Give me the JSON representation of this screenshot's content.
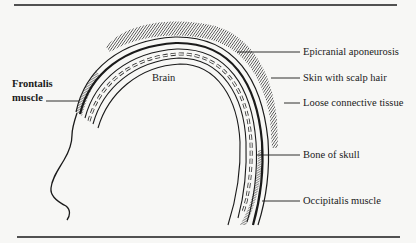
{
  "diagram": {
    "type": "anatomical cross-section of scalp layers (lateral view)",
    "labels": {
      "frontalis_line1": "Frontalis",
      "frontalis_line2": "muscle",
      "brain": "Brain",
      "epicranial": "Epicranial aponeurosis",
      "skin": "Skin with scalp hair",
      "loose": "Loose connective tissue",
      "bone": "Bone of skull",
      "occipitalis": "Occipitalis muscle"
    },
    "colors": {
      "ink": "#1a1a1a",
      "background": "#f7f7f5"
    }
  }
}
